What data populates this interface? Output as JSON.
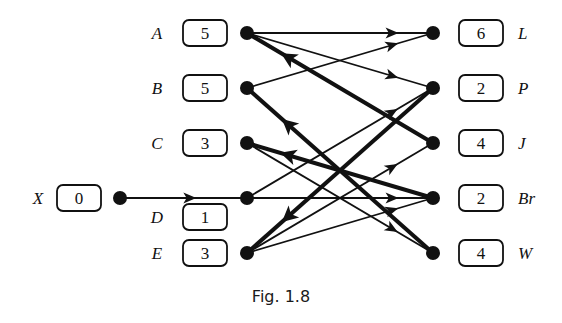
{
  "caption": "Fig. 1.8",
  "colors": {
    "ink": "#111111",
    "background": "#ffffff"
  },
  "source_node": {
    "id": "X",
    "label": "X",
    "value": "0",
    "x": 120,
    "y": 198,
    "box_x": 57,
    "label_x": 38
  },
  "left_nodes": [
    {
      "id": "A",
      "label": "A",
      "value": "5",
      "x": 247,
      "y": 33,
      "box_y": 33
    },
    {
      "id": "B",
      "label": "B",
      "value": "5",
      "x": 247,
      "y": 88,
      "box_y": 88
    },
    {
      "id": "C",
      "label": "C",
      "value": "3",
      "x": 247,
      "y": 143,
      "box_y": 143
    },
    {
      "id": "D",
      "label": "D",
      "value": "1",
      "x": 247,
      "y": 198,
      "box_y": 217
    },
    {
      "id": "E",
      "label": "E",
      "value": "3",
      "x": 247,
      "y": 253,
      "box_y": 253
    }
  ],
  "right_nodes": [
    {
      "id": "L",
      "label": "L",
      "value": "6",
      "x": 433,
      "y": 33
    },
    {
      "id": "P",
      "label": "P",
      "value": "2",
      "x": 433,
      "y": 88
    },
    {
      "id": "J",
      "label": "J",
      "value": "4",
      "x": 433,
      "y": 143
    },
    {
      "id": "Br",
      "label": "Br",
      "value": "2",
      "x": 433,
      "y": 198
    },
    {
      "id": "W",
      "label": "W",
      "value": "4",
      "x": 433,
      "y": 253
    }
  ],
  "edges": [
    {
      "from": "X",
      "to": "D",
      "weight": "thin"
    },
    {
      "from": "A",
      "to": "L",
      "weight": "thin"
    },
    {
      "from": "A",
      "to": "P",
      "weight": "thin"
    },
    {
      "from": "B",
      "to": "L",
      "weight": "thin"
    },
    {
      "from": "C",
      "to": "W",
      "weight": "thin"
    },
    {
      "from": "D",
      "to": "P",
      "weight": "thin"
    },
    {
      "from": "D",
      "to": "Br",
      "weight": "thin"
    },
    {
      "from": "E",
      "to": "J",
      "weight": "thin"
    },
    {
      "from": "E",
      "to": "Br",
      "weight": "thin"
    },
    {
      "from": "J",
      "to": "A",
      "weight": "thick"
    },
    {
      "from": "W",
      "to": "B",
      "weight": "thick"
    },
    {
      "from": "Br",
      "to": "C",
      "weight": "thick"
    },
    {
      "from": "P",
      "to": "E",
      "weight": "thick"
    }
  ]
}
